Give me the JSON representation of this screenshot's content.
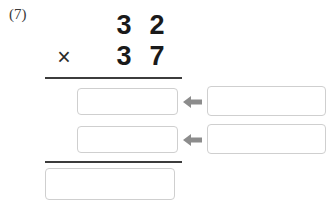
{
  "problem": {
    "number_label": "(7)",
    "operator": "×",
    "multiplicand": {
      "value": "32",
      "tens": "3",
      "ones": "2"
    },
    "multiplier": {
      "value": "37",
      "tens": "3",
      "ones": "7"
    }
  },
  "answer_boxes": {
    "partial_product_1_left": "",
    "partial_product_1_right": "",
    "partial_product_2_left": "",
    "partial_product_2_right": "",
    "final_answer": ""
  },
  "arrows": {
    "arrow_1_name": "arrow-left-icon",
    "arrow_2_name": "arrow-left-icon",
    "color": "#8c8c8c"
  },
  "colors": {
    "background": "#ffffff",
    "digit": "#1a1a1a",
    "rule": "#3c3c3c",
    "box_border": "#cfcfcf",
    "label": "#3a3a3a"
  }
}
